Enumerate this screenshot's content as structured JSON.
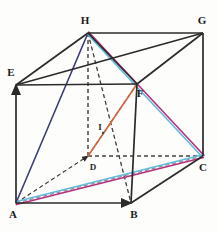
{
  "figure": {
    "background_color": "#fdfdfb",
    "canvas": {
      "width": 218,
      "height": 233
    },
    "vertices": [
      {
        "id": "A",
        "label": "A",
        "x": 16,
        "y": 203,
        "label_x": 13,
        "label_y": 218,
        "hidden": false
      },
      {
        "id": "B",
        "label": "B",
        "x": 131,
        "y": 203,
        "label_x": 134,
        "label_y": 218,
        "hidden": false
      },
      {
        "id": "C",
        "label": "C",
        "x": 203,
        "y": 156,
        "label_x": 203,
        "label_y": 171,
        "hidden": false
      },
      {
        "id": "D",
        "label": "D",
        "x": 88,
        "y": 156,
        "label_x": 93,
        "label_y": 170,
        "hidden": true
      },
      {
        "id": "E",
        "label": "E",
        "x": 16,
        "y": 85,
        "label_x": 11,
        "label_y": 76,
        "hidden": false
      },
      {
        "id": "F",
        "label": "F",
        "x": 137,
        "y": 84,
        "label_x": 140,
        "label_y": 97,
        "hidden": false
      },
      {
        "id": "G",
        "label": "G",
        "x": 203,
        "y": 33,
        "label_x": 202,
        "label_y": 24,
        "hidden": false
      },
      {
        "id": "H",
        "label": "H",
        "x": 88,
        "y": 33,
        "label_x": 85,
        "label_y": 24,
        "hidden": false
      },
      {
        "id": "I",
        "label": "I",
        "x": 103,
        "y": 133,
        "label_x": 100,
        "label_y": 130,
        "hidden": false
      }
    ],
    "colors": {
      "edge_solid": "#2b2b2b",
      "edge_hidden": "#8c8c8c",
      "diagonal_navy": "#3a3d7a",
      "diagonal_magenta": "#b5307d",
      "diagonal_cyan": "#63b9dd",
      "diagonal_orange": "#d4643c",
      "label_text": "#1a1a1a",
      "paper": "#fdfdfb"
    },
    "edges_solid": [
      {
        "name": "edge-A-B",
        "from": "A",
        "to": "B",
        "arrow": true
      },
      {
        "name": "edge-B-C",
        "from": "B",
        "to": "C",
        "arrow": false
      },
      {
        "name": "edge-A-E",
        "from": "A",
        "to": "E",
        "arrow": true
      },
      {
        "name": "edge-B-F",
        "from": "B",
        "to": "F",
        "arrow": false
      },
      {
        "name": "edge-C-G",
        "from": "C",
        "to": "G",
        "arrow": false
      },
      {
        "name": "edge-E-F",
        "from": "E",
        "to": "F",
        "arrow": false
      },
      {
        "name": "edge-F-G",
        "from": "F",
        "to": "G",
        "arrow": false
      },
      {
        "name": "edge-E-H",
        "from": "E",
        "to": "H",
        "arrow": false
      },
      {
        "name": "edge-H-G",
        "from": "H",
        "to": "G",
        "arrow": false
      },
      {
        "name": "edge-H-F",
        "from": "H",
        "to": "F",
        "arrow": false
      },
      {
        "name": "edge-E-F-diag-G",
        "from": "E",
        "to": "G",
        "arrow": false
      }
    ],
    "edges_hidden": [
      {
        "name": "edge-A-D",
        "from": "A",
        "to": "D",
        "arrow": true
      },
      {
        "name": "edge-D-C",
        "from": "D",
        "to": "C",
        "arrow": false
      },
      {
        "name": "edge-D-H",
        "from": "D",
        "to": "H",
        "arrow": false
      },
      {
        "name": "edge-A-C-hidden",
        "from": "A",
        "to": "C",
        "arrow": false
      },
      {
        "name": "edge-H-B-hidden",
        "from": "H",
        "to": "B",
        "arrow": false
      },
      {
        "name": "edge-D-F-hidden",
        "from": "D",
        "to": "F",
        "arrow": false
      }
    ],
    "colored_diagonals": [
      {
        "name": "diagonal-A-H",
        "from": "A",
        "to": "H",
        "color_key": "diagonal_navy",
        "offset": 0.0
      },
      {
        "name": "diagonal-H-C-magenta",
        "from": "H",
        "to": "C",
        "color_key": "diagonal_magenta",
        "offset": -1.2
      },
      {
        "name": "diagonal-H-C-cyan",
        "from": "H",
        "to": "C",
        "color_key": "diagonal_cyan",
        "offset": 1.2
      },
      {
        "name": "diagonal-A-C-magenta",
        "from": "A",
        "to": "C",
        "color_key": "diagonal_magenta",
        "offset": 1.6
      },
      {
        "name": "diagonal-A-C-cyan",
        "from": "A",
        "to": "C",
        "color_key": "diagonal_cyan",
        "offset": -1.2
      },
      {
        "name": "diagonal-D-F-orange",
        "from": "D",
        "to": "F",
        "color_key": "diagonal_orange",
        "offset": 0.0
      }
    ],
    "caption": ""
  }
}
